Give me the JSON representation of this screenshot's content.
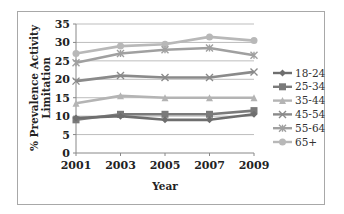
{
  "chart_data": {
    "type": "line",
    "title": "",
    "xlabel": "Year",
    "ylabel": "% Prevalence Activity Limitation",
    "ylabel_lines": [
      "% Prevalence Activity",
      "Limitation"
    ],
    "x": [
      "2001",
      "2003",
      "2005",
      "2007",
      "2009"
    ],
    "yticks": [
      0,
      5,
      10,
      15,
      20,
      25,
      30,
      35
    ],
    "ylim": [
      0,
      35
    ],
    "grid": true,
    "legend_position": "right",
    "series": [
      {
        "name": "18-24",
        "values": [
          9.5,
          10.0,
          9.0,
          9.0,
          10.5
        ],
        "color": "#6e6e6e",
        "marker": "diamond"
      },
      {
        "name": "25-34",
        "values": [
          9.0,
          10.5,
          10.5,
          10.5,
          11.5
        ],
        "color": "#7a7a7a",
        "marker": "square"
      },
      {
        "name": "35-44",
        "values": [
          13.5,
          15.5,
          15.0,
          15.0,
          15.0
        ],
        "color": "#b4b4b4",
        "marker": "triangle"
      },
      {
        "name": "45-54",
        "values": [
          19.5,
          21.0,
          20.5,
          20.5,
          22.0
        ],
        "color": "#8a8a8a",
        "marker": "x"
      },
      {
        "name": "55-64",
        "values": [
          24.5,
          27.0,
          28.0,
          28.5,
          26.5
        ],
        "color": "#a0a0a0",
        "marker": "star"
      },
      {
        "name": "65+",
        "values": [
          27.0,
          29.0,
          29.5,
          31.5,
          30.5
        ],
        "color": "#b8b8b8",
        "marker": "circle"
      }
    ]
  }
}
